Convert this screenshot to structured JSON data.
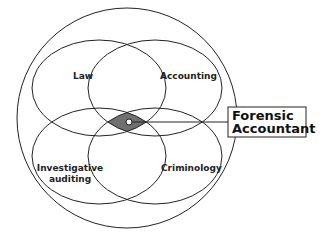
{
  "diagram": {
    "type": "venn",
    "outer_set": {
      "label": ""
    },
    "sets": [
      {
        "id": "law",
        "label": "Law"
      },
      {
        "id": "accounting",
        "label": "Accounting"
      },
      {
        "id": "investigative",
        "label_line1": "Investigative",
        "label_line2": "auditing"
      },
      {
        "id": "criminology",
        "label": "Criminology"
      }
    ],
    "intersection": {
      "label_line1": "Forensic",
      "label_line2": "Accountant",
      "fill": "#707070"
    },
    "colors": {
      "stroke": "#222222",
      "background": "#ffffff"
    }
  }
}
